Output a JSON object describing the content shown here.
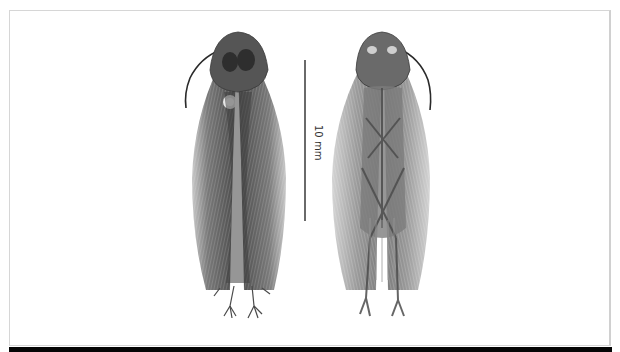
{
  "figure": {
    "type": "specimen-photograph",
    "views": [
      {
        "name": "dorsal",
        "position": "left"
      },
      {
        "name": "ventral",
        "position": "right"
      }
    ],
    "scale_bar": {
      "label": "10 mm",
      "color": "#6a6a6a"
    },
    "colors": {
      "background": "#ffffff",
      "frame_border": "#d6d6d6",
      "bottom_strip": "#050505",
      "specimen_dark": "#3a3a3a",
      "specimen_mid": "#6e6e6e",
      "wing_light": "#a8a8a8"
    }
  }
}
